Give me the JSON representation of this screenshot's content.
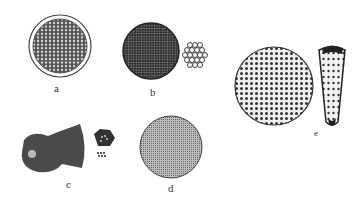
{
  "figure": {
    "panels": [
      {
        "id": "a",
        "label": "a"
      },
      {
        "id": "b",
        "label": "b"
      },
      {
        "id": "c",
        "label": "c"
      },
      {
        "id": "d",
        "label": "d"
      },
      {
        "id": "e",
        "label": "e"
      }
    ]
  }
}
